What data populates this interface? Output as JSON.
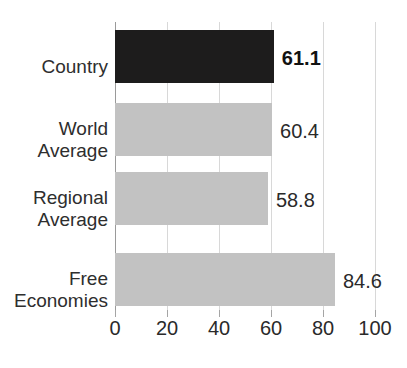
{
  "chart_data": {
    "type": "bar",
    "orientation": "horizontal",
    "title": "",
    "xlabel": "",
    "ylabel": "",
    "xlim": [
      0,
      100
    ],
    "grid": true,
    "legend": "none",
    "categories": [
      "Country",
      "World Average",
      "Regional Average",
      "Free Economies"
    ],
    "values": [
      61.1,
      60.4,
      58.8,
      84.6
    ],
    "value_labels": [
      "61.1",
      "60.4",
      "58.8",
      "84.6"
    ],
    "tick_values": [
      0,
      20,
      40,
      60,
      80,
      100
    ],
    "tick_labels": [
      "0",
      "20",
      "40",
      "60",
      "80",
      "100"
    ],
    "bars": [
      {
        "category": "Country",
        "category_lines": [
          "Country"
        ],
        "value": 61.1,
        "label": "61.1",
        "emphasis": true,
        "color": "#1d1c1c",
        "label_bold": true
      },
      {
        "category": "World Average",
        "category_lines": [
          "World",
          "Average"
        ],
        "value": 60.4,
        "label": "60.4",
        "emphasis": false,
        "color": "#c2c2c2",
        "label_bold": false
      },
      {
        "category": "Regional Average",
        "category_lines": [
          "Regional",
          "Average"
        ],
        "value": 58.8,
        "label": "58.8",
        "emphasis": false,
        "color": "#c2c2c2",
        "label_bold": false
      },
      {
        "category": "Free Economies",
        "category_lines": [
          "Free",
          "Economies"
        ],
        "value": 84.6,
        "label": "84.6",
        "emphasis": false,
        "color": "#c2c2c2",
        "label_bold": false
      }
    ],
    "colors": {
      "highlight_bar": "#1d1c1c",
      "default_bar": "#c2c2c2",
      "gridline": "#d8d8d8",
      "axis": "#9a9a9a",
      "text": "#2a2a2a",
      "background": "#ffffff"
    }
  }
}
